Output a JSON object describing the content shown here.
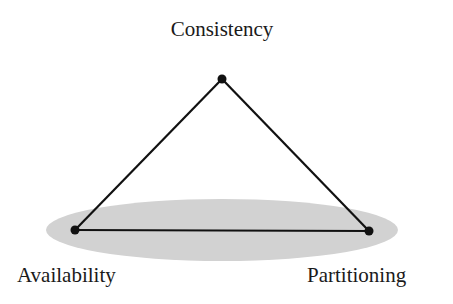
{
  "diagram": {
    "nodes": {
      "top": {
        "label": "Consistency",
        "x": 222,
        "y": 79
      },
      "left": {
        "label": "Availability",
        "x": 75,
        "y": 230
      },
      "right": {
        "label": "Partitioning",
        "x": 369,
        "y": 231
      }
    },
    "edges": [
      [
        "top",
        "left"
      ],
      [
        "top",
        "right"
      ],
      [
        "left",
        "right"
      ]
    ],
    "highlight": {
      "shape": "ellipse",
      "covers": [
        "left",
        "right"
      ],
      "color": "#d2d2d2"
    },
    "colors": {
      "line": "#111111",
      "node": "#111111",
      "text": "#1a1a1a",
      "background": "#ffffff"
    }
  }
}
